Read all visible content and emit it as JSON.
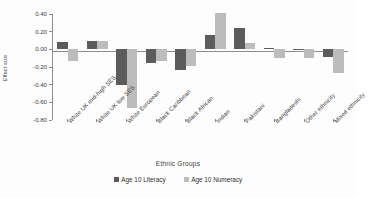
{
  "chart_data": {
    "type": "bar",
    "title": "",
    "xlabel": "Ethnic Groups",
    "ylabel": "Effect size",
    "ylim": [
      -0.8,
      0.4
    ],
    "yticks": [
      "0.40",
      "0.20",
      "0.00",
      "-0.20",
      "-0.40",
      "-0.60",
      "-0.80"
    ],
    "ytick_values": [
      0.4,
      0.2,
      0.0,
      -0.2,
      -0.4,
      -0.6,
      -0.8
    ],
    "grid": false,
    "legend_position": "bottom",
    "categories": [
      "White UK mid-high SES",
      "White UK low SES",
      "White European",
      "Black Caribbean",
      "Black African",
      "Indian",
      "Pakistani",
      "Bangladeshi",
      "Other ethnicity",
      "Mixed ethnicity"
    ],
    "series": [
      {
        "name": "Age 10 Literacy",
        "color": "#5c5c5c",
        "values": [
          0.08,
          0.09,
          -0.4,
          -0.15,
          -0.23,
          0.16,
          0.24,
          0.01,
          0.0,
          -0.09
        ]
      },
      {
        "name": "Age 10 Numeracy",
        "color": "#bcbcbc",
        "values": [
          -0.13,
          0.09,
          -0.66,
          -0.13,
          -0.19,
          0.41,
          0.07,
          -0.1,
          -0.1,
          -0.27
        ]
      }
    ]
  }
}
